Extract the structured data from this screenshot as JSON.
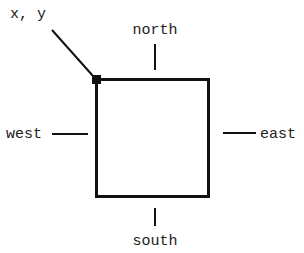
{
  "diagram": {
    "origin_label": "x, y",
    "labels": {
      "north": "north",
      "south": "south",
      "west": "west",
      "east": "east"
    },
    "colors": {
      "line": "#111111",
      "text": "#222222",
      "background": "#ffffff"
    }
  }
}
